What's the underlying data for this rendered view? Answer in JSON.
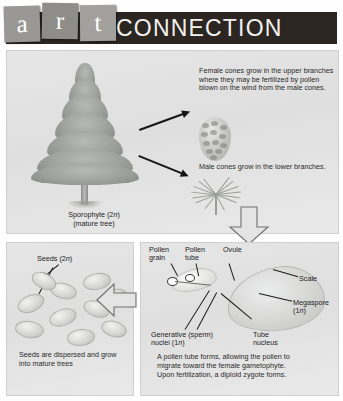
{
  "header": {
    "tiles": [
      "a",
      "r",
      "t"
    ],
    "word": "CONNECTION",
    "bar_color": "#2b2622",
    "tile_color": "#9a9894"
  },
  "panels": {
    "top": {
      "name": "sporophyte-and-cones",
      "tree_label_line1": "Sporophyte (2n)",
      "tree_label_line2": "(mature tree)",
      "female_cone_text": "Female cones grow in the upper branches where they may be fertilized by pollen blown on the wind from the male cones.",
      "male_cone_text": "Male cones grow in the lower branches."
    },
    "bottom_left": {
      "name": "seed-dispersal",
      "seeds_label": "Seeds (2n)",
      "caption": "Seeds are dispersed and grow into mature trees"
    },
    "bottom_right": {
      "name": "pollen-tube-and-ovule",
      "labels": [
        {
          "id": "pollen-grain",
          "line1": "Pollen",
          "line2": "grain"
        },
        {
          "id": "pollen-tube",
          "line1": "Pollen",
          "line2": "tube"
        },
        {
          "id": "ovule",
          "line1": "Ovule",
          "line2": ""
        },
        {
          "id": "scale",
          "line1": "Scale",
          "line2": ""
        },
        {
          "id": "megaspore",
          "line1": "Megaspore",
          "line2": "(1n)"
        },
        {
          "id": "generative-nuclei",
          "line1": "Generative (sperm)",
          "line2": "nuclei (1n)"
        },
        {
          "id": "tube-nucleus",
          "line1": "Tube",
          "line2": "nucleus"
        }
      ],
      "caption_line1": "A pollen tube forms, allowing the pollen to",
      "caption_line2": "migrate toward the female gametophyte.",
      "caption_line3": "Upon fertilization, a diploid zygote forms."
    }
  }
}
